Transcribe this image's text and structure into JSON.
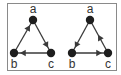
{
  "colors": {
    "edge": "#3a3a3a",
    "node": "#1e1e1e",
    "border": "#8a8a8a",
    "label": "#333333"
  },
  "graphs": [
    {
      "name": "left-graph",
      "nodes": [
        {
          "id": "a",
          "label": "a",
          "x": 33,
          "y": 20,
          "lx": 33,
          "ly": 13
        },
        {
          "id": "b",
          "label": "b",
          "x": 14,
          "y": 53,
          "lx": 14,
          "ly": 68
        },
        {
          "id": "c",
          "label": "c",
          "x": 51,
          "y": 53,
          "lx": 51,
          "ly": 68
        }
      ],
      "edges": [
        {
          "from": "b",
          "to": "a"
        },
        {
          "from": "a",
          "to": "c"
        },
        {
          "from": "c",
          "to": "b"
        }
      ]
    },
    {
      "name": "right-graph",
      "nodes": [
        {
          "id": "a",
          "label": "a",
          "x": 90,
          "y": 20,
          "lx": 90,
          "ly": 13
        },
        {
          "id": "b",
          "label": "b",
          "x": 72,
          "y": 53,
          "lx": 72,
          "ly": 68
        },
        {
          "id": "c",
          "label": "c",
          "x": 108,
          "y": 53,
          "lx": 108,
          "ly": 68
        }
      ],
      "edges": [
        {
          "from": "a",
          "to": "b"
        },
        {
          "from": "b",
          "to": "c"
        },
        {
          "from": "c",
          "to": "a",
          "arrow_pos": 0.55
        }
      ]
    }
  ]
}
